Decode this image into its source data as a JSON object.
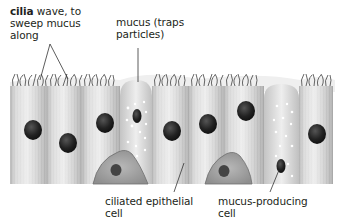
{
  "diagram": {
    "labels": {
      "cilia": {
        "bold": "cilia",
        "rest_line1": " wave, to",
        "line2": "sweep mucus",
        "line3": "along"
      },
      "mucus": {
        "line1": "mucus (traps",
        "line2": "particles)"
      },
      "ciliated_cell": {
        "line1": "ciliated epithelial",
        "line2": "cell"
      },
      "goblet_cell": {
        "line1": "mucus-producing",
        "line2": "cell"
      }
    },
    "components": [
      "cilia",
      "mucus layer",
      "ciliated epithelial cells",
      "mucus-producing (goblet) cells",
      "nuclei",
      "basal cells",
      "mucus droplets"
    ],
    "colors": {
      "cell_light": "#e6e6e6",
      "cell_dark": "#a9a9a9",
      "nucleus": "#1e1e1e",
      "cilia": "#555555",
      "mucus": "#eeeeee",
      "basal_cell": "#9a9a9a",
      "leader_line": "#333333"
    }
  }
}
